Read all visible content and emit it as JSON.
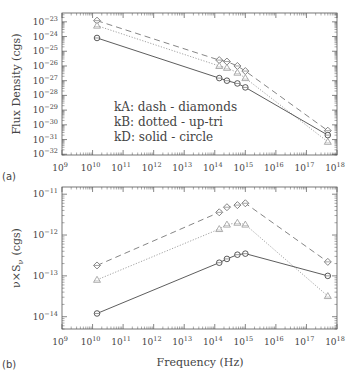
{
  "chart_data": [
    {
      "panel": "(a)",
      "type": "line",
      "title": "",
      "xlabel": "",
      "ylabel": "Flux Density (cgs)",
      "xscale": "log",
      "yscale": "log",
      "xlim": [
        1000000000.0,
        1e+18
      ],
      "ylim": [
        1e-32,
        1e-23
      ],
      "x_tick_labels": [
        "10^9",
        "10^10",
        "10^11",
        "10^12",
        "10^13",
        "10^14",
        "10^15",
        "10^16",
        "10^17",
        "10^18"
      ],
      "y_tick_labels": [
        "10^-23",
        "10^-24",
        "10^-25",
        "10^-26",
        "10^-27",
        "10^-28",
        "10^-29",
        "10^-30",
        "10^-31",
        "10^-32"
      ],
      "grid": false,
      "legend_text": [
        "kA: dash - diamonds",
        "kB: dotted - up-tri",
        "kD: solid - circle"
      ],
      "series": [
        {
          "name": "kA",
          "style": "dash",
          "marker": "diamond",
          "x": [
            14000000000.0,
            140000000000000.0,
            250000000000000.0,
            550000000000000.0,
            1000000000000000.0,
            5e+17
          ],
          "y": [
            1.2e-23,
            2.5e-26,
            2e-26,
            1e-26,
            4.5e-27,
            4e-31
          ]
        },
        {
          "name": "kB",
          "style": "dotted",
          "marker": "up-tri",
          "x": [
            14000000000.0,
            140000000000000.0,
            250000000000000.0,
            550000000000000.0,
            1000000000000000.0,
            5e+17
          ],
          "y": [
            5.5e-24,
            1e-26,
            7.5e-27,
            3.5e-27,
            1.5e-27,
            7e-32
          ]
        },
        {
          "name": "kD",
          "style": "solid",
          "marker": "circle",
          "x": [
            14000000000.0,
            140000000000000.0,
            250000000000000.0,
            550000000000000.0,
            1000000000000000.0,
            5e+17
          ],
          "y": [
            8e-25,
            1.5e-27,
            1e-27,
            6.5e-28,
            3.5e-28,
            2e-31
          ]
        }
      ]
    },
    {
      "panel": "(b)",
      "type": "line",
      "title": "",
      "xlabel": "Frequency (Hz)",
      "ylabel": "ν×S_ν (cgs)",
      "xscale": "log",
      "yscale": "log",
      "xlim": [
        1000000000.0,
        1e+18
      ],
      "ylim": [
        5e-15,
        1.5e-11
      ],
      "x_tick_labels": [
        "10^9",
        "10^10",
        "10^11",
        "10^12",
        "10^13",
        "10^14",
        "10^15",
        "10^16",
        "10^17",
        "10^18"
      ],
      "y_tick_labels": [
        "10^-11",
        "10^-12",
        "10^-13",
        "10^-14"
      ],
      "grid": false,
      "series": [
        {
          "name": "kA",
          "style": "dash",
          "marker": "diamond",
          "x": [
            14000000000.0,
            140000000000000.0,
            250000000000000.0,
            550000000000000.0,
            1000000000000000.0,
            5e+17
          ],
          "y": [
            1.8e-13,
            3.6e-12,
            4.8e-12,
            5.4e-12,
            6e-12,
            2.2e-13
          ]
        },
        {
          "name": "kB",
          "style": "dotted",
          "marker": "up-tri",
          "x": [
            14000000000.0,
            140000000000000.0,
            250000000000000.0,
            550000000000000.0,
            1000000000000000.0,
            5e+17
          ],
          "y": [
            8e-14,
            1.4e-12,
            1.8e-12,
            2e-12,
            1.8e-12,
            3.2e-14
          ]
        },
        {
          "name": "kD",
          "style": "solid",
          "marker": "circle",
          "x": [
            14000000000.0,
            140000000000000.0,
            250000000000000.0,
            550000000000000.0,
            1000000000000000.0,
            5e+17
          ],
          "y": [
            1.2e-14,
            2.1e-13,
            2.6e-13,
            3.3e-13,
            3.5e-13,
            1e-13
          ]
        }
      ]
    }
  ],
  "labels": {
    "panel_a": "(a)",
    "panel_b": "(b)",
    "ylabel_top": "Flux Density (cgs)",
    "ylabel_bottom": "ν×S",
    "ylabel_bottom_sub": "ν",
    "ylabel_bottom_units": "(cgs)",
    "xlabel": "Frequency (Hz)",
    "legend": [
      "kA: dash - diamonds",
      "kB: dotted - up-tri",
      "kD: solid - circle"
    ]
  },
  "colors": {
    "axis": "#555555",
    "kA": "#666666",
    "kB": "#999999",
    "kD": "#333333"
  }
}
